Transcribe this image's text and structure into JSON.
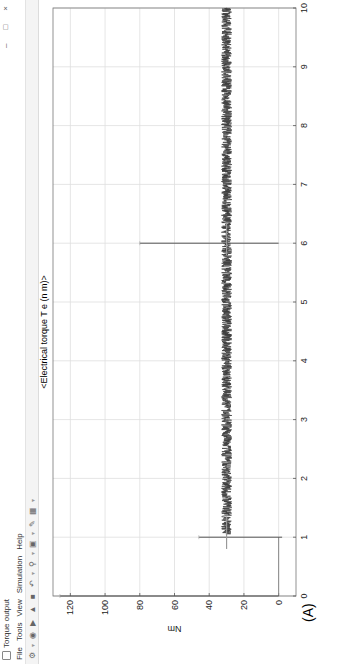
{
  "window": {
    "title": "Torque output",
    "controls": {
      "minimize": "–",
      "restore": "□",
      "close": "×"
    }
  },
  "menu": {
    "items": [
      "File",
      "Tools",
      "View",
      "Simulation",
      "Help"
    ]
  },
  "toolbar": {
    "icons": [
      "settings-icon",
      "highlight-icon",
      "play-icon",
      "step-icon",
      "stop-icon",
      "restore-icon",
      "zoom-icon",
      "fit-icon",
      "style-icon",
      "layout-icon"
    ]
  },
  "figure_label": "(A)",
  "chart_data": {
    "type": "line",
    "title": "<Electrical torque T e (n m)>",
    "xlabel": "",
    "ylabel": "Nm",
    "xlim": [
      0,
      10
    ],
    "ylim": [
      -10,
      130
    ],
    "xticks": [
      0,
      1,
      2,
      3,
      4,
      5,
      6,
      7,
      8,
      9,
      10
    ],
    "yticks": [
      0,
      20,
      40,
      60,
      80,
      100,
      120
    ],
    "grid": true,
    "legend": null,
    "series": [
      {
        "name": "Electrical torque T e",
        "color": "#3a3a3a",
        "description": "Noisy band around 28-32 Nm after startup; transient spikes at t=0, t=1 and t=6",
        "events": [
          {
            "t": 0.0,
            "min": 0,
            "max": 126,
            "note": "startup transient"
          },
          {
            "t": 1.0,
            "min": -2,
            "max": 46,
            "note": "load step spike"
          },
          {
            "t": 6.0,
            "min": 0,
            "max": 80,
            "note": "disturbance spike"
          }
        ],
        "band": {
          "t_start": 1.0,
          "t_end": 10.0,
          "low": 27,
          "high": 33,
          "mean": 30
        },
        "pre_step_level": 0
      }
    ]
  }
}
